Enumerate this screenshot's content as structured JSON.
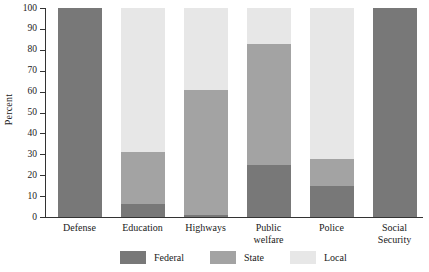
{
  "chart_data": {
    "type": "bar",
    "title": "",
    "subtitle": "",
    "stacked": true,
    "stack_total": 100,
    "xlabel": "",
    "ylabel": "Percent",
    "ylim": [
      0,
      100
    ],
    "ytick_step": 10,
    "yticks": [
      0,
      10,
      20,
      30,
      40,
      50,
      60,
      70,
      80,
      90,
      100
    ],
    "ytick_labels": [
      "0",
      "10",
      "20",
      "30",
      "40",
      "50",
      "60",
      "70",
      "80",
      "90",
      "100"
    ],
    "grid": false,
    "legend_position": "bottom",
    "categories": [
      "Defense",
      "Education",
      "Highways",
      "Public welfare",
      "Police",
      "Social Security"
    ],
    "category_label_lines": [
      [
        "Defense"
      ],
      [
        "Education"
      ],
      [
        "Highways"
      ],
      [
        "Public",
        "welfare"
      ],
      [
        "Police"
      ],
      [
        "Social",
        "Security"
      ]
    ],
    "series": [
      {
        "name": "Federal",
        "color": "#787878",
        "values": [
          100,
          6,
          1,
          25,
          15,
          100
        ]
      },
      {
        "name": "State",
        "color": "#a3a3a3",
        "values": [
          0,
          25,
          60,
          58,
          13,
          0
        ]
      },
      {
        "name": "Local",
        "color": "#e7e7e7",
        "values": [
          0,
          69,
          39,
          17,
          72,
          0
        ]
      }
    ],
    "cumulative_tops": {
      "Defense": [
        100,
        100,
        100
      ],
      "Education": [
        6,
        31,
        100
      ],
      "Highways": [
        1,
        61,
        100
      ],
      "Public welfare": [
        25,
        83,
        100
      ],
      "Police": [
        15,
        28,
        100
      ],
      "Social Security": [
        100,
        100,
        100
      ]
    },
    "legend": [
      {
        "label": "Federal",
        "color": "#787878"
      },
      {
        "label": "State",
        "color": "#a3a3a3"
      },
      {
        "label": "Local",
        "color": "#e7e7e7"
      }
    ]
  }
}
